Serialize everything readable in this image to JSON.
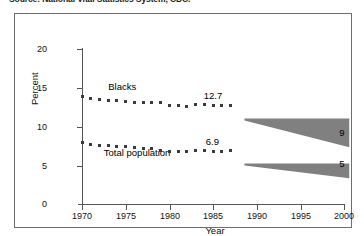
{
  "source_note": "Source: National Vital Statistics System, CDC.",
  "chart_data": {
    "type": "line",
    "title": "",
    "xlabel": "Year",
    "ylabel": "Percent",
    "xlim": [
      1970,
      2000
    ],
    "ylim": [
      0,
      20
    ],
    "xticks": [
      1970,
      1975,
      1980,
      1985,
      1990,
      1995,
      2000
    ],
    "yticks": [
      0,
      5,
      10,
      15,
      20
    ],
    "grid": false,
    "legend": "inline-annotations",
    "series": [
      {
        "name": "Blacks",
        "label": "Blacks",
        "marker": "square",
        "color": "#3a3a3a",
        "x": [
          1970,
          1971,
          1972,
          1973,
          1974,
          1975,
          1976,
          1977,
          1978,
          1979,
          1980,
          1981,
          1982,
          1983,
          1984,
          1985,
          1986,
          1987
        ],
        "values": [
          13.9,
          13.6,
          13.5,
          13.4,
          13.3,
          13.2,
          13.1,
          13.1,
          13.1,
          13.1,
          12.7,
          12.7,
          12.6,
          12.8,
          12.8,
          12.7,
          12.7,
          12.7
        ],
        "end_value_label": "12.7",
        "projection": {
          "start_year": 1987,
          "start_value": 12.7,
          "end_year": 1999,
          "end_upper": 12.7,
          "end_lower": 9,
          "end_label": "9",
          "color": "#808080"
        }
      },
      {
        "name": "Total population",
        "label": "Total population",
        "marker": "square",
        "color": "#3a3a3a",
        "x": [
          1970,
          1971,
          1972,
          1973,
          1974,
          1975,
          1976,
          1977,
          1978,
          1979,
          1980,
          1981,
          1982,
          1983,
          1984,
          1985,
          1986,
          1987
        ],
        "values": [
          7.9,
          7.7,
          7.6,
          7.5,
          7.4,
          7.4,
          7.3,
          7.1,
          7.1,
          6.9,
          6.8,
          6.8,
          6.8,
          6.9,
          6.9,
          6.8,
          6.8,
          6.9
        ],
        "end_value_label": "6.9",
        "projection": {
          "start_year": 1987,
          "start_value": 6.9,
          "end_year": 1999,
          "end_upper": 6.9,
          "end_lower": 5,
          "end_label": "5",
          "color": "#808080"
        }
      }
    ]
  }
}
